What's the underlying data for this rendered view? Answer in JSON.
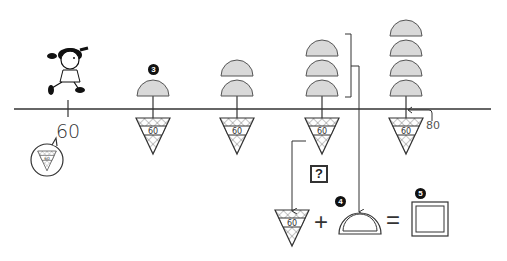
{
  "diagram": {
    "start_label": "60",
    "end_label": "80",
    "cone_label": "60",
    "badges": {
      "step3": "3",
      "step4": "4",
      "step5": "5"
    },
    "question_mark": "?",
    "equation": {
      "plus": "+",
      "equals": "="
    },
    "stacks": [
      {
        "position": 1,
        "scoops": 1
      },
      {
        "position": 2,
        "scoops": 2
      },
      {
        "position": 3,
        "scoops": 3
      },
      {
        "position": 4,
        "scoops": 4
      }
    ],
    "colors": {
      "scoop_fill": "#d9d9d9",
      "line": "#333333",
      "background": "#ffffff"
    }
  }
}
